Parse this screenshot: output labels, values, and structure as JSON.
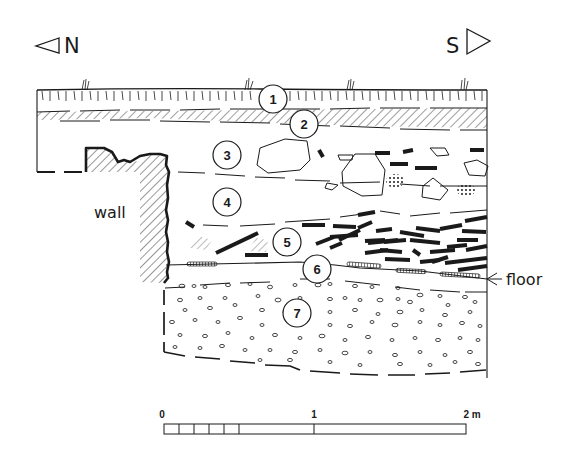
{
  "orientation": {
    "left": {
      "label": "N",
      "icon": "triangle-left-icon"
    },
    "right": {
      "label": "S",
      "icon": "triangle-right-icon"
    }
  },
  "labels": {
    "wall": "wall",
    "floor": "floor"
  },
  "layers": [
    {
      "id": 1,
      "label": "1"
    },
    {
      "id": 2,
      "label": "2"
    },
    {
      "id": 3,
      "label": "3"
    },
    {
      "id": 4,
      "label": "4"
    },
    {
      "id": 5,
      "label": "5"
    },
    {
      "id": 6,
      "label": "6"
    },
    {
      "id": 7,
      "label": "7"
    }
  ],
  "scale_bar": {
    "ticks": [
      "0",
      "1",
      "2 m"
    ]
  },
  "colors": {
    "ink": "#1a1a1a",
    "background": "#ffffff"
  }
}
